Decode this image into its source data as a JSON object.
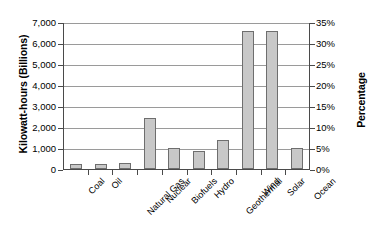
{
  "chart_data": {
    "type": "bar",
    "title": "",
    "subtitle": "",
    "xlabel": "",
    "ylabel": "Kilowatt-hours (Billions)",
    "y2label": "Percentage",
    "categories": [
      "Coal",
      "Oil",
      "Natural Gas",
      "Nuclear",
      "Biofuels",
      "Hydro",
      "Geothermal",
      "Wind",
      "Solar",
      "Ocean"
    ],
    "values": [
      250,
      260,
      280,
      2450,
      1000,
      880,
      1400,
      6550,
      6550,
      1000
    ],
    "series": [
      {
        "name": "Kilowatt-hours (Billions)",
        "values": [
          250,
          260,
          280,
          2450,
          1000,
          880,
          1400,
          6550,
          6550,
          1000
        ]
      }
    ],
    "ylim": [
      0,
      7000
    ],
    "y2lim": [
      0,
      35
    ],
    "yticks": [
      0,
      1000,
      2000,
      3000,
      4000,
      5000,
      6000,
      7000
    ],
    "ytick_labels": [
      "0",
      "1,000",
      "2,000",
      "3,000",
      "4,000",
      "5,000",
      "6,000",
      "7,000"
    ],
    "y2ticks": [
      0,
      5,
      10,
      15,
      20,
      25,
      30,
      35
    ],
    "y2tick_labels": [
      "0%",
      "5%",
      "10%",
      "15%",
      "20%",
      "25%",
      "30%",
      "35%"
    ],
    "grid": true,
    "grid_axis": "y",
    "legend": false,
    "legend_position": "none",
    "bar_fill_color": "#c8c8c8",
    "bar_edge_color": "#6e6e6e",
    "axis_color": "#4a4a4a",
    "gridline_color": "#9a9a9a",
    "background_color": "#ffffff",
    "xtick_label_rotation": -45
  }
}
